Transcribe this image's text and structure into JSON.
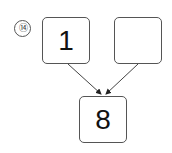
{
  "problem": {
    "number_label": "⑭",
    "left_box": "1",
    "right_box": "",
    "bottom_box": "8"
  },
  "colors": {
    "line": "#444444",
    "text": "#111111"
  }
}
